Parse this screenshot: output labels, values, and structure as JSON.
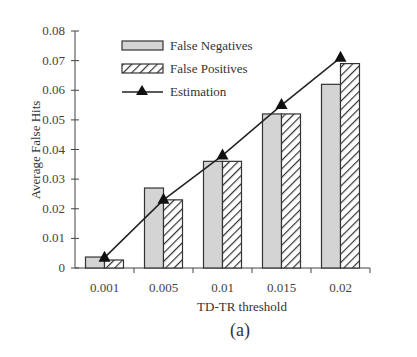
{
  "chart_data": {
    "type": "bar",
    "title": "",
    "xlabel": "TD-TR threshold",
    "ylabel": "Average False Hits",
    "caption": "(a)",
    "categories": [
      "0.001",
      "0.005",
      "0.01",
      "0.015",
      "0.02"
    ],
    "ylim": [
      0,
      0.08
    ],
    "yticks": [
      "0",
      "0.01",
      "0.02",
      "0.03",
      "0.04",
      "0.05",
      "0.06",
      "0.07",
      "0.08"
    ],
    "grid": false,
    "legend_position": "upper-left inside",
    "series": [
      {
        "name": "False Negatives",
        "type": "bar",
        "style": "gray-fill",
        "values": [
          0.0037,
          0.027,
          0.036,
          0.052,
          0.062
        ]
      },
      {
        "name": "False Positives",
        "type": "bar",
        "style": "hatched",
        "values": [
          0.0027,
          0.023,
          0.036,
          0.052,
          0.069
        ]
      },
      {
        "name": "Estimation",
        "type": "line",
        "marker": "triangle",
        "values": [
          0.0035,
          0.023,
          0.038,
          0.055,
          0.071
        ]
      }
    ],
    "colors": {
      "bar_fill": "#d4d4d4",
      "stroke": "#333333",
      "line": "#222222"
    }
  }
}
